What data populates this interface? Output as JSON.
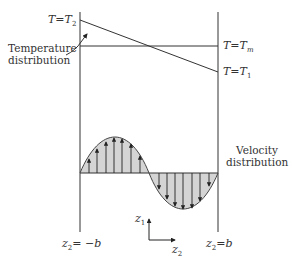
{
  "labels": {
    "t2": {
      "var": "T",
      "eq": "=",
      "sym": "T",
      "sub": "2"
    },
    "tm": {
      "var": "T",
      "eq": "=",
      "sym": "T",
      "sub": "m"
    },
    "t1": {
      "var": "T",
      "eq": "=",
      "sym": "T",
      "sub": "1"
    },
    "temperature_distribution": [
      "Temperature",
      "distribution"
    ],
    "velocity_distribution": [
      "Velocity",
      "distribution"
    ],
    "left_wall": {
      "var": "z",
      "sub": "2",
      "rest": "= −b"
    },
    "right_wall": {
      "var": "z",
      "sub": "2",
      "rest": "=b"
    },
    "axis_z1": {
      "var": "z",
      "sub": "1"
    },
    "axis_z2": {
      "var": "z",
      "sub": "2"
    }
  },
  "colors": {
    "line": "#333333",
    "fill": "#d4d4d4"
  }
}
